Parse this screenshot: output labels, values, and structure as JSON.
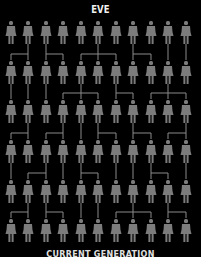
{
  "header": {
    "title": "EVE"
  },
  "footer": {
    "label": "CURRENT GENERATION"
  },
  "colors": {
    "background": "#000000",
    "figure": "#7c7c7c",
    "connector": "#8a8a8a",
    "text": "#f0f0f0"
  },
  "grid": {
    "columns_x": [
      11,
      28,
      46,
      63,
      81,
      98,
      116,
      133,
      151,
      168,
      186
    ],
    "rows_y": [
      21,
      61,
      100,
      140,
      180,
      219
    ],
    "figure_icon": "female-figure-icon"
  },
  "connections": [
    {
      "from_row": 0,
      "links": [
        [
          1,
          [
            0,
            1
          ]
        ],
        [
          2,
          [
            2,
            3
          ]
        ],
        [
          5,
          [
            4,
            5,
            6
          ]
        ],
        [
          7,
          [
            7,
            8
          ]
        ],
        [
          9,
          [
            9
          ]
        ],
        [
          10,
          [
            10
          ]
        ]
      ]
    },
    {
      "from_row": 1,
      "links": [
        [
          0,
          [
            0
          ]
        ],
        [
          1,
          [
            1
          ]
        ],
        [
          2,
          [
            2
          ]
        ],
        [
          4,
          [
            3,
            4,
            5
          ]
        ],
        [
          6,
          [
            6,
            7
          ]
        ],
        [
          9,
          [
            8,
            9,
            10
          ]
        ]
      ]
    },
    {
      "from_row": 2,
      "links": [
        [
          1,
          [
            0,
            1
          ]
        ],
        [
          3,
          [
            2,
            3
          ]
        ],
        [
          4,
          [
            4
          ]
        ],
        [
          5,
          [
            5,
            6
          ]
        ],
        [
          7,
          [
            7,
            8
          ]
        ],
        [
          10,
          [
            9,
            10
          ]
        ]
      ]
    },
    {
      "from_row": 3,
      "links": [
        [
          0,
          [
            0
          ]
        ],
        [
          2,
          [
            1,
            2
          ]
        ],
        [
          3,
          [
            3
          ]
        ],
        [
          4,
          [
            4,
            5
          ]
        ],
        [
          6,
          [
            6
          ]
        ],
        [
          7,
          [
            7
          ]
        ],
        [
          8,
          [
            8,
            9
          ]
        ],
        [
          10,
          [
            10
          ]
        ]
      ]
    },
    {
      "from_row": 4,
      "links": [
        [
          1,
          [
            0,
            1
          ]
        ],
        [
          2,
          [
            2,
            3
          ]
        ],
        [
          4,
          [
            4
          ]
        ],
        [
          5,
          [
            5
          ]
        ],
        [
          7,
          [
            6,
            7,
            8
          ]
        ],
        [
          9,
          [
            9,
            10
          ]
        ]
      ]
    }
  ]
}
